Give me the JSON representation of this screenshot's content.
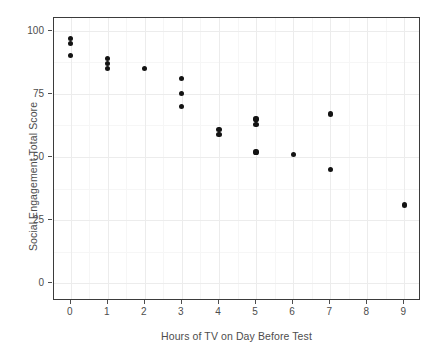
{
  "chart_data": {
    "type": "scatter",
    "title": "",
    "xlabel": "Hours of TV on Day Before Test",
    "ylabel": "Social Engagement Total Score",
    "xlim": [
      -0.45,
      9.45
    ],
    "ylim": [
      -7,
      105
    ],
    "xticks": [
      0,
      1,
      2,
      3,
      4,
      5,
      6,
      7,
      8,
      9
    ],
    "xtick_labels": [
      "0",
      "1",
      "2",
      "3",
      "4",
      "5",
      "6",
      "7",
      "8",
      "9"
    ],
    "yticks": [
      0,
      25,
      50,
      75,
      100
    ],
    "ytick_labels": [
      "0",
      "25",
      "50",
      "75",
      "100"
    ],
    "grid": true,
    "legend": "none",
    "marker_color": "#131313",
    "panel_background": "#ffffff",
    "grid_color": "#ececec",
    "points": [
      {
        "x": 0,
        "y": 97
      },
      {
        "x": 0,
        "y": 95
      },
      {
        "x": 0,
        "y": 90
      },
      {
        "x": 1,
        "y": 89
      },
      {
        "x": 1,
        "y": 87
      },
      {
        "x": 1,
        "y": 85
      },
      {
        "x": 2,
        "y": 85
      },
      {
        "x": 3,
        "y": 81
      },
      {
        "x": 3,
        "y": 75
      },
      {
        "x": 3,
        "y": 70
      },
      {
        "x": 4,
        "y": 61
      },
      {
        "x": 4,
        "y": 59
      },
      {
        "x": 5,
        "y": 65
      },
      {
        "x": 5,
        "y": 63
      },
      {
        "x": 5,
        "y": 52
      },
      {
        "x": 6,
        "y": 51
      },
      {
        "x": 7,
        "y": 67
      },
      {
        "x": 7,
        "y": 45
      },
      {
        "x": 9,
        "y": 31
      }
    ]
  }
}
